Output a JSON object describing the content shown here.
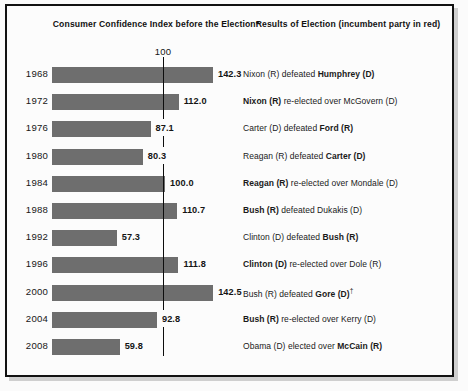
{
  "figure": {
    "header_left": "Consumer Confidence Index before the Election*",
    "header_right": "Results of Election (incumbent party in red)",
    "reference_label": "100"
  },
  "colors": {
    "bar_fill": "#6e6e6e",
    "frame": "#121212",
    "background": "#fbfbfb",
    "text": "#1a1a1a"
  },
  "chart_data": {
    "type": "bar",
    "title": "Consumer Confidence Index before the Election*",
    "xlabel": "",
    "ylabel": "",
    "orientation": "horizontal",
    "reference_line": 100,
    "xlim": [
      0,
      150
    ],
    "grid": false,
    "legend": "none",
    "categories": [
      "1968",
      "1972",
      "1976",
      "1980",
      "1984",
      "1988",
      "1992",
      "1996",
      "2000",
      "2004",
      "2008"
    ],
    "values": [
      142.3,
      112.0,
      87.1,
      80.3,
      100.0,
      110.7,
      57.3,
      111.8,
      142.5,
      92.8,
      59.8
    ],
    "value_labels": [
      "142.3",
      "112.0",
      "87.1",
      "80.3",
      "100.0",
      "110.7",
      "57.3",
      "111.8",
      "142.5",
      "92.8",
      "59.8"
    ],
    "annotations": [
      "Nixon (R) defeated Humphrey (D)",
      "Nixon (R) re-elected over McGovern (D)",
      "Carter (D) defeated Ford (R)",
      "Reagan (R) defeated Carter (D)",
      "Reagan (R) re-elected over Mondale (D)",
      "Bush (R) defeated Dukakis (D)",
      "Clinton (D) defeated Bush (R)",
      "Clinton (D) re-elected over Dole (R)",
      "Bush (R) defeated Gore (D)†",
      "Bush (R) re-elected over Kerry (D)",
      "Obama (D) elected over McCain (R)"
    ]
  },
  "rows": [
    {
      "year": "1968",
      "value": 142.3,
      "value_label": "142.3",
      "result_pre": "Nixon (R) defeated ",
      "result_bold": "Humphrey (D)",
      "result_post": "",
      "result_bold_first": false,
      "dagger": false
    },
    {
      "year": "1972",
      "value": 112.0,
      "value_label": "112.0",
      "result_pre": "",
      "result_bold": "Nixon (R)",
      "result_post": " re-elected over McGovern (D)",
      "result_bold_first": true,
      "dagger": false
    },
    {
      "year": "1976",
      "value": 87.1,
      "value_label": "87.1",
      "result_pre": "Carter (D) defeated ",
      "result_bold": "Ford (R)",
      "result_post": "",
      "result_bold_first": false,
      "dagger": false
    },
    {
      "year": "1980",
      "value": 80.3,
      "value_label": "80.3",
      "result_pre": "Reagan (R) defeated ",
      "result_bold": "Carter (D)",
      "result_post": "",
      "result_bold_first": false,
      "dagger": false
    },
    {
      "year": "1984",
      "value": 100.0,
      "value_label": "100.0",
      "result_pre": "",
      "result_bold": "Reagan (R)",
      "result_post": " re-elected over Mondale (D)",
      "result_bold_first": true,
      "dagger": false
    },
    {
      "year": "1988",
      "value": 110.7,
      "value_label": "110.7",
      "result_pre": "",
      "result_bold": "Bush (R)",
      "result_post": " defeated Dukakis (D)",
      "result_bold_first": true,
      "dagger": false
    },
    {
      "year": "1992",
      "value": 57.3,
      "value_label": "57.3",
      "result_pre": "Clinton (D) defeated ",
      "result_bold": "Bush (R)",
      "result_post": "",
      "result_bold_first": false,
      "dagger": false
    },
    {
      "year": "1996",
      "value": 111.8,
      "value_label": "111.8",
      "result_pre": "",
      "result_bold": "Clinton (D)",
      "result_post": " re-elected over Dole (R)",
      "result_bold_first": true,
      "dagger": false
    },
    {
      "year": "2000",
      "value": 142.5,
      "value_label": "142.5",
      "result_pre": "Bush (R) defeated ",
      "result_bold": "Gore (D)",
      "result_post": "",
      "result_bold_first": false,
      "dagger": true
    },
    {
      "year": "2004",
      "value": 92.8,
      "value_label": "92.8",
      "result_pre": "",
      "result_bold": "Bush (R)",
      "result_post": " re-elected over Kerry (D)",
      "result_bold_first": true,
      "dagger": false
    },
    {
      "year": "2008",
      "value": 59.8,
      "value_label": "59.8",
      "result_pre": "Obama (D) elected over ",
      "result_bold": "McCain (R)",
      "result_post": "",
      "result_bold_first": false,
      "dagger": false
    }
  ]
}
